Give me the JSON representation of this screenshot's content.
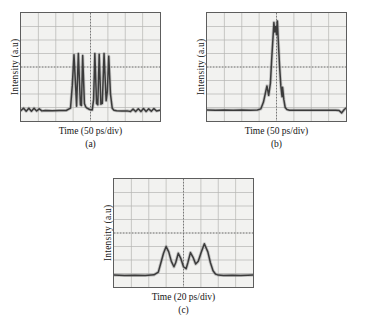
{
  "figure": {
    "background": "#ffffff",
    "trace_color": "#3b3b3b",
    "grid_color": "#b4b4b2",
    "frame_color": "#5d5d5d",
    "screen_color": "#f2f2f0"
  },
  "panels": [
    {
      "id": "a",
      "letter": "(a)",
      "xlabel": "Time (50 ps/div)",
      "ylabel": "Intensity (a.u)"
    },
    {
      "id": "b",
      "letter": "(b)",
      "xlabel": "Time (50 ps/div)",
      "ylabel": "Intensity (a.u)"
    },
    {
      "id": "c",
      "letter": "(c)",
      "xlabel": "Time (20 ps/div)",
      "ylabel": "Intensity (a.u)"
    }
  ],
  "chart_data": [
    {
      "type": "line",
      "title": "(a)",
      "xlabel": "Time (50 ps/div)",
      "ylabel": "Intensity (a.u)",
      "xlim": [
        0,
        8
      ],
      "ylim": [
        0,
        8
      ],
      "x_unit": "div",
      "x_div_value": 50,
      "x_div_unit": "ps",
      "grid": true,
      "grid_divisions_x": 8,
      "grid_divisions_y": 8,
      "crosshair_x": 4,
      "crosshair_y": 4,
      "description": "Mode-locked pulse burst: flat low baseline with small ripple, a packet of ~7 narrow high-amplitude spikes centred on screen, returning to baseline.",
      "baseline_level": 0.75,
      "peak_level": 5.0,
      "burst_start_div": 2.9,
      "burst_end_div": 5.3,
      "peaks_x": [
        3.05,
        3.3,
        3.55,
        4.25,
        4.5,
        4.78,
        5.05
      ],
      "peaks_y": [
        4.9,
        5.0,
        4.85,
        5.0,
        4.95,
        5.0,
        4.8
      ],
      "series": [
        {
          "name": "intensity",
          "x": [
            0.0,
            0.15,
            0.3,
            0.45,
            0.6,
            0.75,
            0.9,
            1.05,
            1.2,
            1.4,
            1.8,
            2.2,
            2.6,
            2.85,
            2.95,
            3.05,
            3.15,
            3.2,
            3.3,
            3.42,
            3.48,
            3.55,
            3.65,
            3.72,
            3.8,
            3.95,
            4.1,
            4.18,
            4.25,
            4.35,
            4.42,
            4.5,
            4.6,
            4.68,
            4.78,
            4.9,
            4.97,
            5.05,
            5.15,
            5.25,
            5.35,
            5.5,
            5.8,
            6.1,
            6.3,
            6.45,
            6.6,
            6.75,
            6.9,
            7.05,
            7.2,
            7.35,
            7.5,
            7.65,
            7.8,
            8.0
          ],
          "y": [
            0.78,
            0.95,
            0.72,
            0.95,
            0.72,
            0.95,
            0.74,
            0.9,
            0.75,
            0.78,
            0.76,
            0.77,
            0.78,
            0.95,
            2.6,
            4.9,
            2.4,
            1.1,
            5.0,
            1.2,
            1.15,
            4.85,
            1.3,
            1.05,
            0.95,
            0.85,
            0.82,
            1.6,
            5.0,
            1.3,
            1.2,
            4.95,
            1.25,
            1.3,
            5.0,
            1.5,
            2.2,
            4.8,
            2.0,
            0.95,
            0.8,
            0.76,
            0.74,
            0.75,
            0.7,
            0.88,
            0.7,
            0.9,
            0.7,
            0.92,
            0.7,
            0.9,
            0.72,
            0.92,
            0.74,
            0.8
          ]
        }
      ]
    },
    {
      "type": "line",
      "title": "(b)",
      "xlabel": "Time (50 ps/div)",
      "ylabel": "Intensity (a.u)",
      "xlim": [
        0,
        8
      ],
      "ylim": [
        0,
        8
      ],
      "x_unit": "div",
      "x_div_value": 50,
      "x_div_unit": "ps",
      "grid": true,
      "grid_divisions_x": 8,
      "grid_divisions_y": 8,
      "crosshair_x": 4,
      "crosshair_y": 4,
      "description": "Single tall noisy central spike reaching near top of screen, flanked by two smaller side lobes, on a flat low baseline.",
      "baseline_level": 0.8,
      "peak_level": 7.4,
      "burst_start_div": 3.2,
      "burst_end_div": 4.6,
      "peaks_x": [
        3.45,
        3.85,
        4.05,
        4.35
      ],
      "peaks_y": [
        2.6,
        7.3,
        7.4,
        2.5
      ],
      "series": [
        {
          "name": "intensity",
          "x": [
            0.0,
            0.5,
            1.0,
            1.5,
            2.0,
            2.5,
            2.9,
            3.1,
            3.25,
            3.35,
            3.45,
            3.55,
            3.65,
            3.72,
            3.8,
            3.85,
            3.9,
            3.95,
            4.0,
            4.05,
            4.1,
            4.18,
            4.25,
            4.32,
            4.35,
            4.42,
            4.5,
            4.6,
            4.75,
            5.0,
            5.5,
            6.0,
            6.5,
            7.0,
            7.4,
            7.6,
            7.75,
            7.9,
            8.0
          ],
          "y": [
            0.82,
            0.8,
            0.81,
            0.8,
            0.82,
            0.8,
            0.82,
            0.9,
            1.4,
            2.0,
            2.6,
            1.9,
            2.8,
            4.5,
            6.2,
            7.3,
            6.6,
            7.0,
            6.4,
            7.4,
            6.0,
            4.0,
            2.6,
            1.8,
            2.5,
            1.6,
            1.0,
            0.85,
            0.8,
            0.8,
            0.8,
            0.8,
            0.8,
            0.8,
            0.8,
            0.78,
            0.6,
            0.85,
            0.95
          ]
        }
      ]
    },
    {
      "type": "line",
      "title": "(c)",
      "xlabel": "Time (20 ps/div)",
      "ylabel": "Intensity (a.u)",
      "xlim": [
        0,
        8
      ],
      "ylim": [
        0,
        8
      ],
      "x_unit": "div",
      "x_div_value": 20,
      "x_div_unit": "ps",
      "grid": true,
      "grid_divisions_x": 8,
      "grid_divisions_y": 8,
      "crosshair_x": 4,
      "crosshair_y": 4,
      "description": "Broad envelope containing four resolved sub-pulses of similar height, rising from and returning to a flat baseline; small noise cloud above the middle of the burst.",
      "baseline_level": 0.85,
      "peak_level": 3.2,
      "burst_start_div": 2.5,
      "burst_end_div": 5.9,
      "peaks_x": [
        3.0,
        3.7,
        4.4,
        5.2
      ],
      "peaks_y": [
        3.0,
        2.5,
        2.55,
        3.2
      ],
      "series": [
        {
          "name": "intensity",
          "x": [
            0.0,
            0.6,
            1.2,
            1.8,
            2.3,
            2.55,
            2.7,
            2.85,
            3.0,
            3.15,
            3.3,
            3.45,
            3.55,
            3.7,
            3.85,
            4.0,
            4.15,
            4.25,
            4.4,
            4.55,
            4.7,
            4.85,
            5.0,
            5.2,
            5.4,
            5.55,
            5.7,
            5.85,
            6.0,
            6.3,
            6.8,
            7.3,
            7.7,
            8.0
          ],
          "y": [
            0.88,
            0.86,
            0.87,
            0.86,
            0.9,
            1.1,
            1.8,
            2.5,
            3.0,
            2.6,
            1.9,
            1.5,
            1.8,
            2.5,
            2.1,
            1.5,
            1.35,
            1.8,
            2.55,
            2.2,
            1.7,
            1.9,
            2.5,
            3.2,
            2.6,
            1.8,
            1.2,
            0.95,
            0.88,
            0.86,
            0.87,
            0.86,
            0.87,
            0.88
          ]
        }
      ]
    }
  ]
}
